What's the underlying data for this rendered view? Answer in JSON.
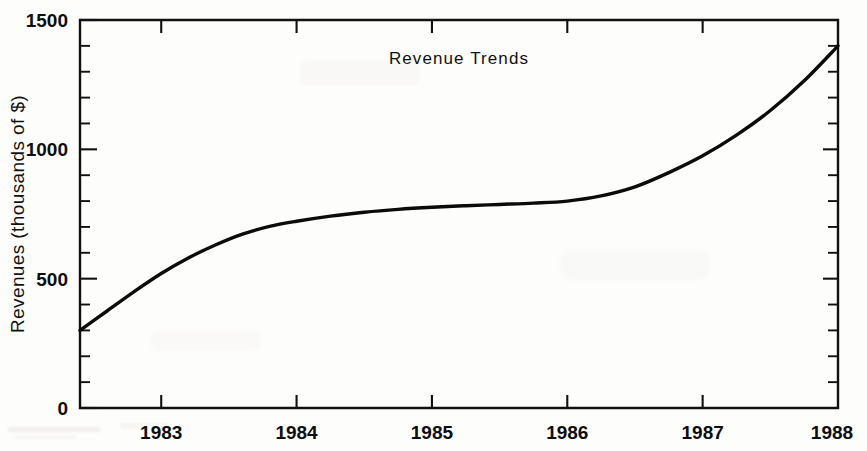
{
  "chart_data": {
    "type": "line",
    "title": "Revenue Trends",
    "xlabel": "",
    "ylabel": "Revenues (thousands of $)",
    "xlim": [
      1982.4,
      1988
    ],
    "ylim": [
      0,
      1500
    ],
    "grid": false,
    "legend": null,
    "y_ticks": [
      0,
      500,
      1000,
      1500
    ],
    "y_tick_labels": [
      "0",
      "500",
      "1000",
      "1500"
    ],
    "y_minor_tick_step": 100,
    "x_ticks": [
      1983,
      1984,
      1985,
      1986,
      1987,
      1988
    ],
    "x_tick_labels": [
      "1983",
      "1984",
      "1985",
      "1986",
      "1987",
      "1988"
    ],
    "series": [
      {
        "name": "Revenues",
        "color": "#0b0b0b",
        "x": [
          1982.4,
          1982.6,
          1982.8,
          1983.0,
          1983.2,
          1983.4,
          1983.6,
          1983.8,
          1984.0,
          1984.25,
          1984.5,
          1984.75,
          1985.0,
          1985.25,
          1985.5,
          1985.75,
          1986.0,
          1986.25,
          1986.5,
          1986.75,
          1987.0,
          1987.25,
          1987.5,
          1987.75,
          1988.0
        ],
        "y": [
          300,
          375,
          450,
          520,
          580,
          630,
          672,
          702,
          722,
          742,
          757,
          768,
          776,
          782,
          787,
          792,
          800,
          820,
          855,
          910,
          975,
          1055,
          1150,
          1265,
          1400
        ]
      }
    ]
  },
  "axes_geometry": {
    "plot_left": 80,
    "plot_right": 838,
    "plot_top": 20,
    "plot_bottom": 408
  }
}
